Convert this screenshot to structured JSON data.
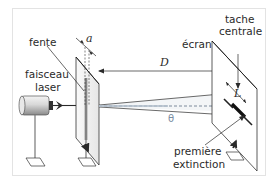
{
  "diagram": {
    "labels": {
      "fente": "fente",
      "a": "a",
      "faisceau": "faisceau",
      "laser": "laser",
      "D": "D",
      "ecran": "écran",
      "tache": "tache",
      "centrale": "centrale",
      "L": "L",
      "theta": "θ",
      "premiere": "première",
      "extinction": "extinction"
    },
    "colors": {
      "line": "#2a2a2a",
      "border": "#e3e3e3",
      "beam": "#9aa6b2",
      "theta": "#7b8da3"
    }
  }
}
